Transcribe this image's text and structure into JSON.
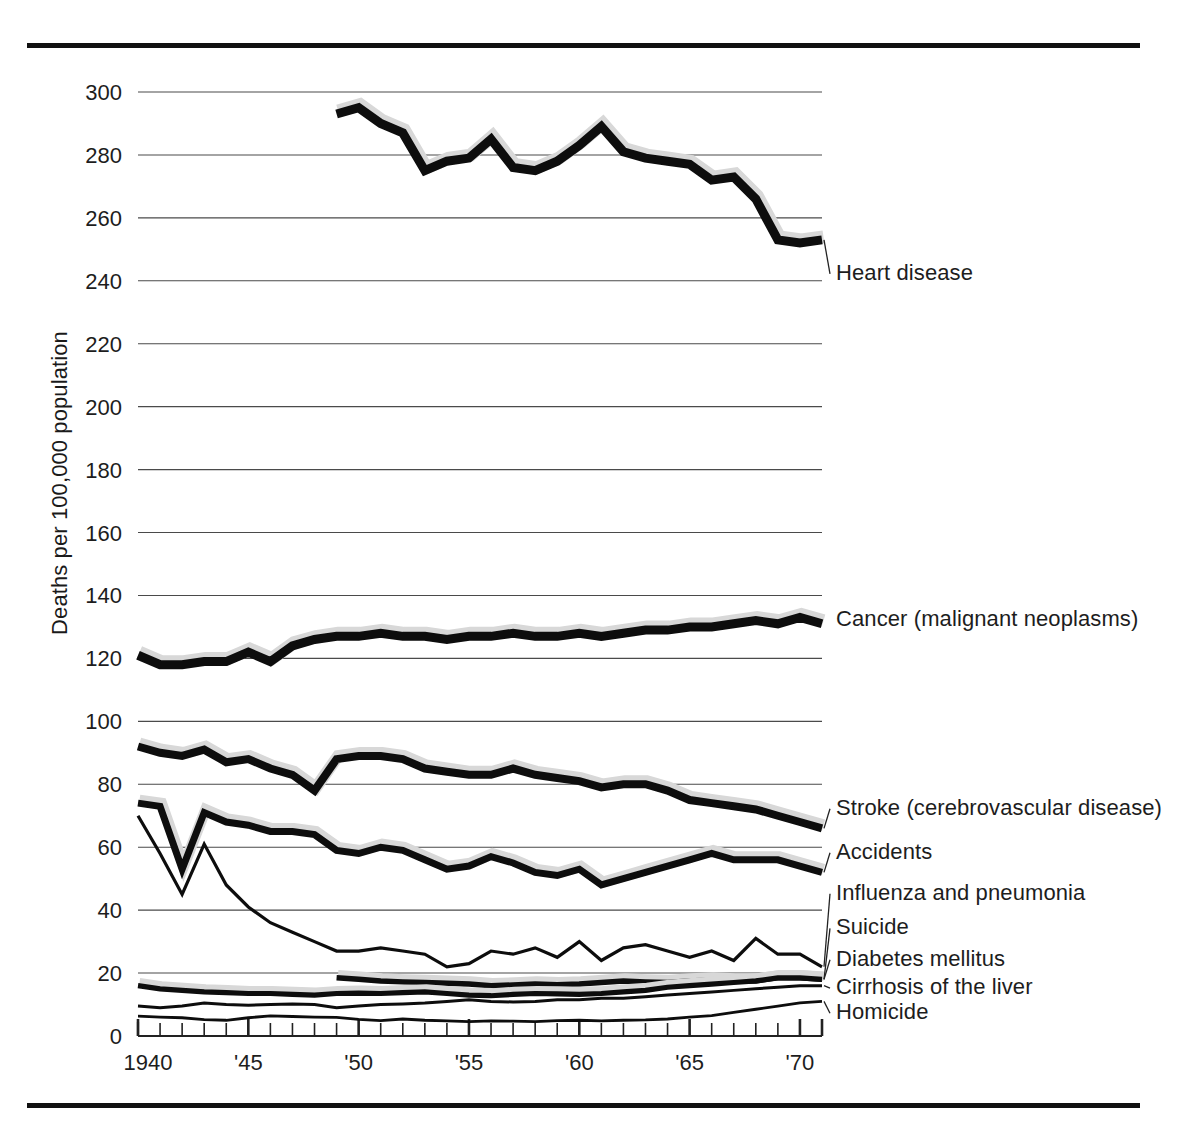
{
  "figure": {
    "has_top_rule": true,
    "has_bottom_rule": true,
    "rule_color": "#111111",
    "background": "#ffffff"
  },
  "axis_title_y": "Deaths per 100,000 population",
  "chart_data": {
    "type": "line",
    "title": "",
    "subtitle": "",
    "xlabel": "",
    "ylabel": "Deaths per 100,000 population",
    "xlim": [
      1940,
      1971
    ],
    "ylim": [
      0,
      300
    ],
    "yticks": [
      0,
      20,
      40,
      60,
      80,
      100,
      120,
      140,
      160,
      180,
      200,
      220,
      240,
      260,
      280,
      300
    ],
    "ytick_labels": [
      "0",
      "20",
      "40",
      "60",
      "80",
      "100",
      "120",
      "140",
      "160",
      "180",
      "200",
      "220",
      "240",
      "260",
      "280",
      "300"
    ],
    "xticks": [
      1940,
      1941,
      1942,
      1943,
      1944,
      1945,
      1946,
      1947,
      1948,
      1949,
      1950,
      1951,
      1952,
      1953,
      1954,
      1955,
      1956,
      1957,
      1958,
      1959,
      1960,
      1961,
      1962,
      1963,
      1964,
      1965,
      1966,
      1967,
      1968,
      1969,
      1970,
      1971
    ],
    "xtick_labels_shown": [
      {
        "x": 1940,
        "label": "1940"
      },
      {
        "x": 1945,
        "label": "'45"
      },
      {
        "x": 1950,
        "label": "'50"
      },
      {
        "x": 1955,
        "label": "'55"
      },
      {
        "x": 1960,
        "label": "'60"
      },
      {
        "x": 1965,
        "label": "'65"
      },
      {
        "x": 1970,
        "label": "'70"
      }
    ],
    "xtick_major": [
      1940,
      1945,
      1950,
      1955,
      1960,
      1965,
      1970
    ],
    "grid": "horizontal",
    "legend_position": "right-inline-labels",
    "line_color": "#0d0d0d",
    "halo_color": "#d8d8d8",
    "series": [
      {
        "name": "Heart disease",
        "label": "Heart disease",
        "weight": "heavy",
        "stroke_width": 9,
        "label_y": 240,
        "x": [
          1949,
          1950,
          1951,
          1952,
          1953,
          1954,
          1955,
          1956,
          1957,
          1958,
          1959,
          1960,
          1961,
          1962,
          1963,
          1964,
          1965,
          1966,
          1967,
          1968,
          1969,
          1970,
          1971
        ],
        "values": [
          293,
          295,
          290,
          287,
          275,
          278,
          279,
          285,
          276,
          275,
          278,
          283,
          289,
          281,
          279,
          278,
          277,
          272,
          273,
          266,
          253,
          252,
          253
        ]
      },
      {
        "name": "Cancer (malignant neoplasms)",
        "label": "Cancer (malignant neoplasms)",
        "weight": "heavy",
        "stroke_width": 9,
        "label_y": 130,
        "x": [
          1940,
          1941,
          1942,
          1943,
          1944,
          1945,
          1946,
          1947,
          1948,
          1949,
          1950,
          1951,
          1952,
          1953,
          1954,
          1955,
          1956,
          1957,
          1958,
          1959,
          1960,
          1961,
          1962,
          1963,
          1964,
          1965,
          1966,
          1967,
          1968,
          1969,
          1970,
          1971
        ],
        "values": [
          121,
          118,
          118,
          119,
          119,
          122,
          119,
          124,
          126,
          127,
          127,
          128,
          127,
          127,
          126,
          127,
          127,
          128,
          127,
          127,
          128,
          127,
          128,
          129,
          129,
          130,
          130,
          131,
          132,
          131,
          133,
          131
        ]
      },
      {
        "name": "Stroke (cerebrovascular disease)",
        "label": "Stroke (cerebrovascular disease)",
        "weight": "heavy",
        "stroke_width": 8,
        "label_y": 70,
        "x": [
          1940,
          1941,
          1942,
          1943,
          1944,
          1945,
          1946,
          1947,
          1948,
          1949,
          1950,
          1951,
          1952,
          1953,
          1954,
          1955,
          1956,
          1957,
          1958,
          1959,
          1960,
          1961,
          1962,
          1963,
          1964,
          1965,
          1966,
          1967,
          1968,
          1969,
          1970,
          1971
        ],
        "values": [
          92,
          90,
          89,
          91,
          87,
          88,
          85,
          83,
          78,
          88,
          89,
          89,
          88,
          85,
          84,
          83,
          83,
          85,
          83,
          82,
          81,
          79,
          80,
          80,
          78,
          75,
          74,
          73,
          72,
          70,
          68,
          66
        ]
      },
      {
        "name": "Accidents",
        "label": "Accidents",
        "weight": "medium",
        "stroke_width": 7,
        "label_y": 56,
        "x": [
          1940,
          1941,
          1942,
          1943,
          1944,
          1945,
          1946,
          1947,
          1948,
          1949,
          1950,
          1951,
          1952,
          1953,
          1954,
          1955,
          1956,
          1957,
          1958,
          1959,
          1960,
          1961,
          1962,
          1963,
          1964,
          1965,
          1966,
          1967,
          1968,
          1969,
          1970,
          1971
        ],
        "values": [
          74,
          73,
          53,
          71,
          68,
          67,
          65,
          65,
          64,
          59,
          58,
          60,
          59,
          56,
          53,
          54,
          57,
          55,
          52,
          51,
          53,
          48,
          50,
          52,
          54,
          56,
          58,
          56,
          56,
          56,
          54,
          52
        ]
      },
      {
        "name": "Influenza and pneumonia",
        "label": "Influenza and pneumonia",
        "weight": "thin",
        "stroke_width": 3.2,
        "label_y": 43,
        "x": [
          1940,
          1941,
          1942,
          1943,
          1944,
          1945,
          1946,
          1947,
          1948,
          1949,
          1950,
          1951,
          1952,
          1953,
          1954,
          1955,
          1956,
          1957,
          1958,
          1959,
          1960,
          1961,
          1962,
          1963,
          1964,
          1965,
          1966,
          1967,
          1968,
          1969,
          1970,
          1971
        ],
        "values": [
          70,
          58,
          45,
          61,
          48,
          41,
          36,
          33,
          30,
          27,
          27,
          28,
          27,
          26,
          22,
          23,
          27,
          26,
          28,
          25,
          30,
          24,
          28,
          29,
          27,
          25,
          27,
          24,
          31,
          26,
          26,
          22
        ]
      },
      {
        "name": "Suicide",
        "label": "Suicide",
        "weight": "medium",
        "stroke_width": 5.5,
        "label_y": 32,
        "x": [
          1949,
          1950,
          1951,
          1952,
          1953,
          1954,
          1955,
          1956,
          1957,
          1958,
          1959,
          1960,
          1961,
          1962,
          1963,
          1964,
          1965,
          1966,
          1967,
          1968,
          1969,
          1970,
          1971
        ],
        "values": [
          18.5,
          18,
          17.5,
          17.2,
          17,
          16.8,
          16.5,
          16,
          16.2,
          16.5,
          16.3,
          16.5,
          17,
          17.5,
          17.2,
          17,
          17.5,
          17.8,
          17.5,
          17.5,
          18.5,
          18.5,
          18
        ]
      },
      {
        "name": "Diabetes mellitus",
        "label": "Diabetes mellitus",
        "weight": "medium",
        "stroke_width": 5.2,
        "label_y": 22,
        "x": [
          1940,
          1941,
          1942,
          1943,
          1944,
          1945,
          1946,
          1947,
          1948,
          1949,
          1950,
          1951,
          1952,
          1953,
          1954,
          1955,
          1956,
          1957,
          1958,
          1959,
          1960,
          1961,
          1962,
          1963,
          1964,
          1965,
          1966,
          1967,
          1968,
          1969,
          1970,
          1971
        ],
        "values": [
          16,
          15,
          14.5,
          14,
          13.8,
          13.5,
          13.5,
          13.2,
          13,
          13.5,
          13.6,
          13.5,
          13.8,
          14,
          13.5,
          13,
          12.8,
          13.2,
          13.5,
          13.4,
          13.2,
          13.5,
          14,
          14.5,
          15.5,
          16,
          16.5,
          17,
          17.5,
          18.5,
          18.5,
          18
        ]
      },
      {
        "name": "Cirrhosis of the liver",
        "label": "Cirrhosis of the liver",
        "weight": "thin",
        "stroke_width": 3,
        "label_y": 13,
        "x": [
          1940,
          1941,
          1942,
          1943,
          1944,
          1945,
          1946,
          1947,
          1948,
          1949,
          1950,
          1951,
          1952,
          1953,
          1954,
          1955,
          1956,
          1957,
          1958,
          1959,
          1960,
          1961,
          1962,
          1963,
          1964,
          1965,
          1966,
          1967,
          1968,
          1969,
          1970,
          1971
        ],
        "values": [
          9.5,
          9,
          9.5,
          10.5,
          10,
          9.8,
          10,
          10.2,
          10,
          9,
          9.5,
          10,
          10.2,
          10.5,
          11,
          11.5,
          11,
          10.8,
          11,
          11.5,
          11.5,
          12,
          12,
          12.5,
          13,
          13.5,
          14,
          14.5,
          15,
          15.5,
          16,
          16
        ]
      },
      {
        "name": "Homicide",
        "label": "Homicide",
        "weight": "thin",
        "stroke_width": 2.8,
        "label_y": 5,
        "x": [
          1940,
          1941,
          1942,
          1943,
          1944,
          1945,
          1946,
          1947,
          1948,
          1949,
          1950,
          1951,
          1952,
          1953,
          1954,
          1955,
          1956,
          1957,
          1958,
          1959,
          1960,
          1961,
          1962,
          1963,
          1964,
          1965,
          1966,
          1967,
          1968,
          1969,
          1970,
          1971
        ],
        "values": [
          6.3,
          6,
          5.8,
          5.2,
          5,
          5.8,
          6.4,
          6.2,
          6,
          5.9,
          5.3,
          4.9,
          5.4,
          5,
          4.8,
          4.6,
          4.8,
          4.7,
          4.6,
          4.9,
          5,
          4.8,
          5,
          5.1,
          5.4,
          6,
          6.5,
          7.5,
          8.5,
          9.5,
          10.5,
          11
        ]
      }
    ]
  }
}
